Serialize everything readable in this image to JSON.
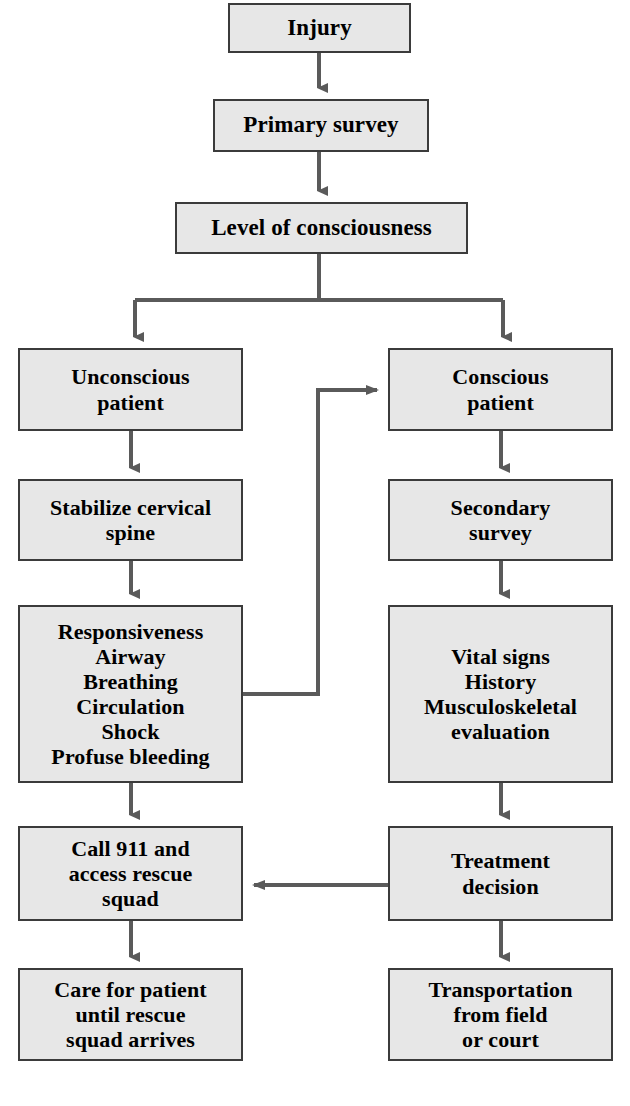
{
  "diagram": {
    "style": {
      "node_fill": "#e7e7e7",
      "node_border": "#3b3b3b",
      "edge_color": "#5a5a5a",
      "text_color": "#000000",
      "background": "#ffffff"
    },
    "nodes": [
      {
        "id": "injury",
        "label": "Injury"
      },
      {
        "id": "primary",
        "label": "Primary survey"
      },
      {
        "id": "loc",
        "label": "Level of consciousness"
      },
      {
        "id": "unconscious",
        "label": "Unconscious\npatient"
      },
      {
        "id": "conscious",
        "label": "Conscious\npatient"
      },
      {
        "id": "stabilize",
        "label": "Stabilize cervical\nspine"
      },
      {
        "id": "secondary",
        "label": "Secondary\nsurvey"
      },
      {
        "id": "abc",
        "label": "Responsiveness\nAirway\nBreathing\nCirculation\nShock\nProfuse bleeding"
      },
      {
        "id": "vitals",
        "label": "Vital signs\nHistory\nMusculoskeletal\nevaluation"
      },
      {
        "id": "call911",
        "label": "Call 911 and\naccess rescue\nsquad"
      },
      {
        "id": "treatment",
        "label": "Treatment\ndecision"
      },
      {
        "id": "care",
        "label": "Care for patient\nuntil rescue\nsquad arrives"
      },
      {
        "id": "transport",
        "label": "Transportation\nfrom field\nor court"
      }
    ],
    "edges": [
      {
        "from": "injury",
        "to": "primary",
        "kind": "straight-down"
      },
      {
        "from": "primary",
        "to": "loc",
        "kind": "straight-down"
      },
      {
        "from": "loc",
        "to": "unconscious",
        "kind": "split-left"
      },
      {
        "from": "loc",
        "to": "conscious",
        "kind": "split-right"
      },
      {
        "from": "unconscious",
        "to": "stabilize",
        "kind": "straight-down"
      },
      {
        "from": "stabilize",
        "to": "abc",
        "kind": "straight-down"
      },
      {
        "from": "abc",
        "to": "call911",
        "kind": "straight-down"
      },
      {
        "from": "call911",
        "to": "care",
        "kind": "straight-down"
      },
      {
        "from": "conscious",
        "to": "secondary",
        "kind": "straight-down"
      },
      {
        "from": "secondary",
        "to": "vitals",
        "kind": "straight-down"
      },
      {
        "from": "vitals",
        "to": "treatment",
        "kind": "straight-down"
      },
      {
        "from": "treatment",
        "to": "transport",
        "kind": "straight-down"
      },
      {
        "from": "abc",
        "to": "conscious",
        "kind": "feedback-up-right"
      },
      {
        "from": "treatment",
        "to": "call911",
        "kind": "straight-left"
      }
    ]
  }
}
